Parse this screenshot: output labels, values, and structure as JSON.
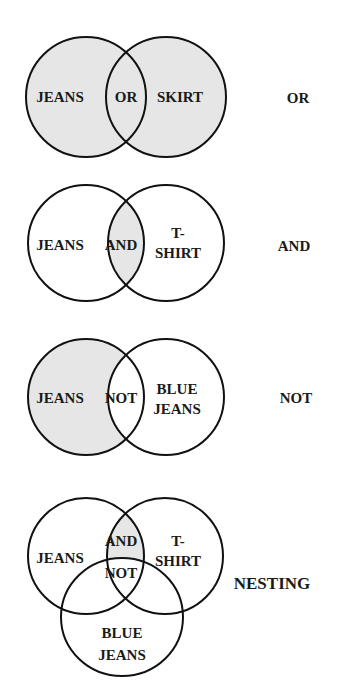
{
  "colors": {
    "shade": "#e6e6e6",
    "stroke": "#111111",
    "background": "#ffffff"
  },
  "diagrams": [
    {
      "name": "or",
      "operator_label": "OR",
      "shaded_region": "union",
      "labels": {
        "left": "JEANS",
        "center": "OR",
        "right": "SKIRT"
      }
    },
    {
      "name": "and",
      "operator_label": "AND",
      "shaded_region": "intersection",
      "labels": {
        "left": "JEANS",
        "center": "AND",
        "right_line1": "T-",
        "right_line2": "SHIRT"
      }
    },
    {
      "name": "not",
      "operator_label": "NOT",
      "shaded_region": "left-minus-right",
      "labels": {
        "left": "JEANS",
        "center": "NOT",
        "right_line1": "BLUE",
        "right_line2": "JEANS"
      }
    },
    {
      "name": "nesting",
      "operator_label": "NESTING",
      "shaded_region": "intersection-of-top-minus-bottom",
      "labels": {
        "left": "JEANS",
        "center_top": "AND",
        "center_bottom": "NOT",
        "right_line1": "T-",
        "right_line2": "SHIRT",
        "bottom_line1": "BLUE",
        "bottom_line2": "JEANS"
      }
    }
  ]
}
